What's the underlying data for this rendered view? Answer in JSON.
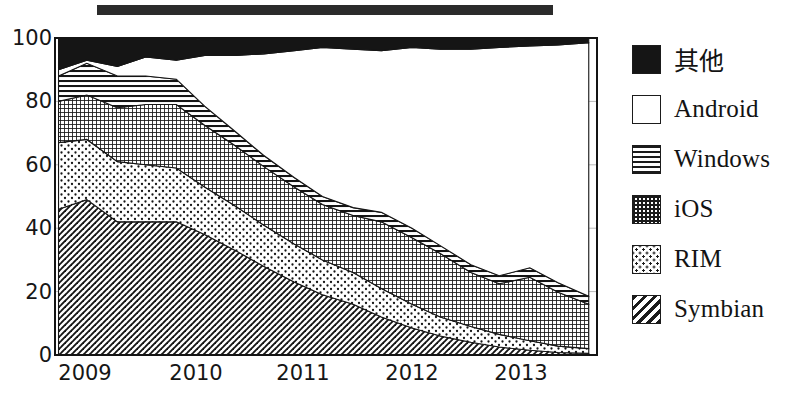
{
  "title_bar": {
    "redacted": true
  },
  "legend": {
    "position": "right",
    "items": [
      {
        "label": "其他",
        "pattern": "solid-black",
        "swatch_class": "sw-other",
        "cjk": true
      },
      {
        "label": "Android",
        "pattern": "solid-white",
        "swatch_class": "sw-android",
        "cjk": false
      },
      {
        "label": "Windows",
        "pattern": "horizontal-lines",
        "swatch_class": "sw-windows",
        "cjk": false
      },
      {
        "label": "iOS",
        "pattern": "crosshatch-grid",
        "swatch_class": "sw-ios",
        "cjk": false
      },
      {
        "label": "RIM",
        "pattern": "dots",
        "swatch_class": "sw-rim",
        "cjk": false
      },
      {
        "label": "Symbian",
        "pattern": "diagonal-hatch",
        "swatch_class": "sw-symbian",
        "cjk": false
      }
    ]
  },
  "axes": {
    "y_ticks": [
      "0",
      "20",
      "40",
      "60",
      "80",
      "100"
    ],
    "x_ticks": [
      "2009",
      "2010",
      "2011",
      "2012",
      "2013"
    ]
  },
  "chart_data": {
    "type": "area",
    "title": "",
    "xlabel": "",
    "ylabel": "",
    "ylim": [
      0,
      100
    ],
    "xlim": [
      2008.85,
      2013.45
    ],
    "grid": true,
    "grid_values": [
      20,
      40,
      60,
      80
    ],
    "stacked": true,
    "stack_order_bottom_to_top": [
      "Symbian",
      "RIM",
      "iOS",
      "Windows",
      "Android",
      "其他"
    ],
    "legend_position": "right",
    "x": [
      2008.88,
      2009.12,
      2009.38,
      2009.62,
      2009.88,
      2010.12,
      2010.38,
      2010.62,
      2010.88,
      2011.12,
      2011.38,
      2011.62,
      2011.88,
      2012.12,
      2012.38,
      2012.62,
      2012.88,
      2013.12,
      2013.38
    ],
    "series": [
      {
        "name": "Symbian",
        "pattern": "diagonal-hatch",
        "values": [
          46,
          49,
          42,
          42,
          42,
          38,
          33,
          28,
          23,
          19,
          16,
          12,
          8.5,
          6,
          4,
          2.5,
          1.5,
          0.8,
          0.5
        ]
      },
      {
        "name": "RIM",
        "pattern": "dots",
        "values": [
          21,
          19,
          19,
          18,
          17,
          15,
          14,
          13,
          12,
          11,
          10,
          9,
          7.5,
          6,
          5,
          4,
          3,
          2,
          1.5
        ]
      },
      {
        "name": "iOS",
        "pattern": "crosshatch-grid",
        "values": [
          13,
          14,
          17,
          19,
          20,
          19.5,
          19,
          18.5,
          18,
          17.5,
          18,
          21,
          21,
          20,
          17,
          16,
          20,
          17,
          14
        ]
      },
      {
        "name": "Windows",
        "pattern": "horizontal-lines",
        "values": [
          8,
          10,
          10,
          9,
          8,
          6,
          4.5,
          3.5,
          3,
          2.5,
          2.5,
          3,
          3,
          2.5,
          2.5,
          2.5,
          3,
          3,
          2.5
        ]
      },
      {
        "name": "Android",
        "pattern": "solid-white",
        "values": [
          2,
          1,
          3,
          6,
          6,
          16,
          24,
          32,
          40,
          47,
          50,
          51,
          57,
          62,
          68,
          72,
          70,
          75,
          80
        ]
      },
      {
        "name": "其他",
        "pattern": "solid-black",
        "values": [
          10,
          7,
          9,
          6,
          7,
          5,
          5.5,
          5,
          4,
          3,
          3.5,
          4,
          3,
          3.5,
          3.5,
          3,
          2,
          2.2,
          1.5
        ]
      }
    ]
  }
}
